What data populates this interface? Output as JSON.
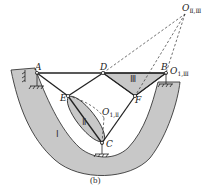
{
  "figure": {
    "caption": "(b)",
    "points": {
      "A": "A",
      "B": "B",
      "C": "C",
      "D": "D",
      "E": "E",
      "F": "F"
    },
    "instant_centers": {
      "O_II_III": {
        "main": "O",
        "sub": "Ⅱ,Ⅲ"
      },
      "O_I_III": {
        "main": "O",
        "sub": "1,Ⅲ"
      },
      "O_I_II": {
        "main": "O",
        "sub": "1,Ⅱ"
      }
    },
    "rigid_bodies": {
      "body_I": "Ⅰ",
      "body_II": "Ⅱ",
      "body_III": "Ⅲ"
    },
    "colors": {
      "fill": "#c8c8c8",
      "stroke": "#222222",
      "dashed": "#333333"
    }
  }
}
